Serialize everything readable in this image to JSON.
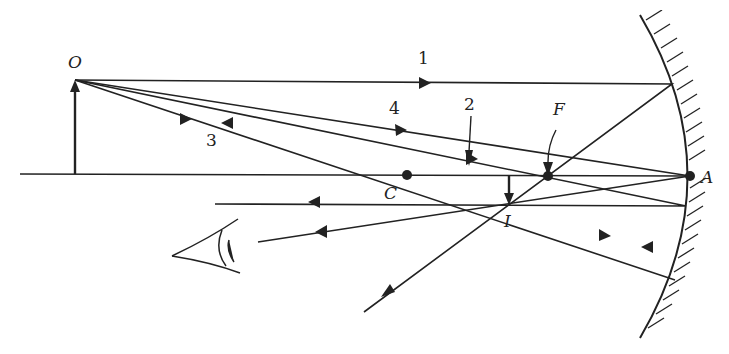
{
  "diagram": {
    "colors": {
      "ink": "#222222",
      "background": "#ffffff"
    },
    "labels": {
      "object": "O",
      "center": "C",
      "focus": "F",
      "vertex": "A",
      "image": "I",
      "ray1": "1",
      "ray2": "2",
      "ray3": "3",
      "ray4": "4"
    },
    "points": {
      "object_tip": [
        75,
        80
      ],
      "object_base": [
        75,
        174
      ],
      "C": [
        407,
        175
      ],
      "F": [
        548,
        176
      ],
      "A": [
        690,
        176
      ],
      "I": [
        506,
        205
      ]
    },
    "elements": [
      "object-arrow",
      "principal-axis",
      "concave-mirror",
      "image-arrow",
      "eye"
    ]
  }
}
